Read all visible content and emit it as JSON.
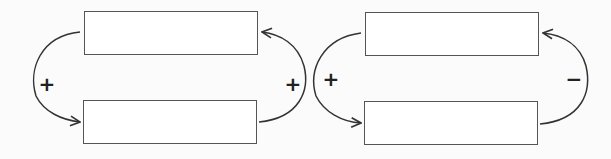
{
  "diagrams": [
    {
      "name": "reinforcing-loop",
      "boxes": [
        {
          "label": "",
          "x": 84,
          "y": 11,
          "w": 174,
          "h": 44
        },
        {
          "label": "",
          "x": 83,
          "y": 100,
          "w": 174,
          "h": 44
        }
      ],
      "links": [
        {
          "sign": "+",
          "side": "left",
          "sign_x": 47,
          "sign_y": 84
        },
        {
          "sign": "+",
          "side": "right",
          "sign_x": 293,
          "sign_y": 84
        }
      ]
    },
    {
      "name": "balancing-loop",
      "boxes": [
        {
          "label": "",
          "x": 365,
          "y": 12,
          "w": 174,
          "h": 44
        },
        {
          "label": "",
          "x": 364,
          "y": 101,
          "w": 174,
          "h": 44
        }
      ],
      "links": [
        {
          "sign": "+",
          "side": "left",
          "sign_x": 331,
          "sign_y": 79
        },
        {
          "sign": "−",
          "side": "right",
          "sign_x": 574,
          "sign_y": 79
        }
      ]
    }
  ],
  "colors": {
    "stroke": "#555555",
    "arrow": "#333333",
    "sign": "#222222"
  }
}
